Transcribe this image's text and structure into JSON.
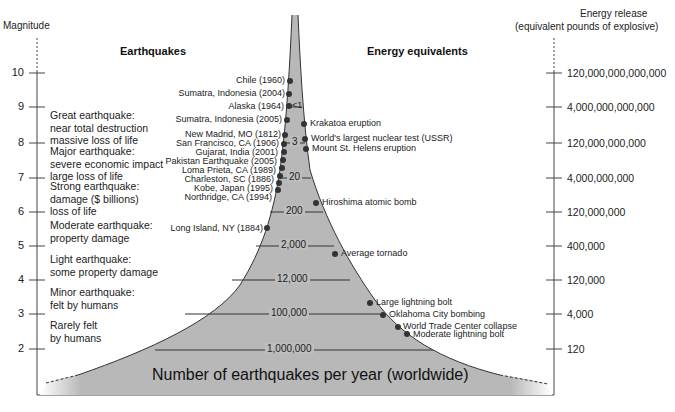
{
  "left_axis": {
    "title": "Magnitude",
    "ticks": [
      "10",
      "9",
      "8",
      "7",
      "6",
      "5",
      "4",
      "3",
      "2"
    ]
  },
  "right_axis": {
    "title_line1": "Energy release",
    "title_line2": "(equivalent pounds of explosive)",
    "ticks": [
      "120,000,000,000,000",
      "4,000,000,000,000",
      "120,000,000,000",
      "4,000,000,000",
      "120,000,000",
      "400,000",
      "120,000",
      "4,000",
      "120"
    ]
  },
  "headers": {
    "earthquakes": "Earthquakes",
    "energy": "Energy equivalents"
  },
  "descriptions": [
    {
      "line1": "Great earthquake:",
      "line2": "near total destruction",
      "line3": "massive loss of life"
    },
    {
      "line1": "Major earthquake:",
      "line2": "severe economic impact",
      "line3": "large loss of life"
    },
    {
      "line1": "Strong earthquake:",
      "line2": "damage ($ billions)",
      "line3": "loss of life"
    },
    {
      "line1": "Moderate earthquake:",
      "line2": "property damage",
      "line3": ""
    },
    {
      "line1": "Light earthquake:",
      "line2": "some property damage",
      "line3": ""
    },
    {
      "line1": "Minor earthquake:",
      "line2": "felt by humans",
      "line3": ""
    },
    {
      "line1": "Rarely felt",
      "line2": "by humans",
      "line3": ""
    }
  ],
  "earthquakes": [
    "Chile (1960)",
    "Sumatra, Indonesia (2004)",
    "Alaska (1964)",
    "Sumatra, Indonesia (2005)",
    "New Madrid, MO (1812)",
    "San Francisco, CA (1906)",
    "Gujarat, India (2001)",
    "Pakistan Earthquake (2005)",
    "Loma Prieta, CA (1989)",
    "Charleston, SC (1886)",
    "Kobe, Japan (1995)",
    "Northridge, CA (1994)",
    "Long Island, NY (1884)"
  ],
  "energy_events": [
    "Krakatoa eruption",
    "World's largest nuclear test (USSR)",
    "Mount St. Helens eruption",
    "Hiroshima atomic bomb",
    "Average tornado",
    "Large lightning bolt",
    "Oklahoma City bombing",
    "World Trade Center collapse",
    "Moderate lightning bolt"
  ],
  "counts": [
    "<1",
    "3",
    "20",
    "200",
    "2,000",
    "12,000",
    "100,000",
    "1,000,000"
  ],
  "bottom_label": "Number of earthquakes per year (worldwide)",
  "colors": {
    "fill": "#b8b8b8",
    "line": "#333333",
    "dot": "#333333"
  }
}
